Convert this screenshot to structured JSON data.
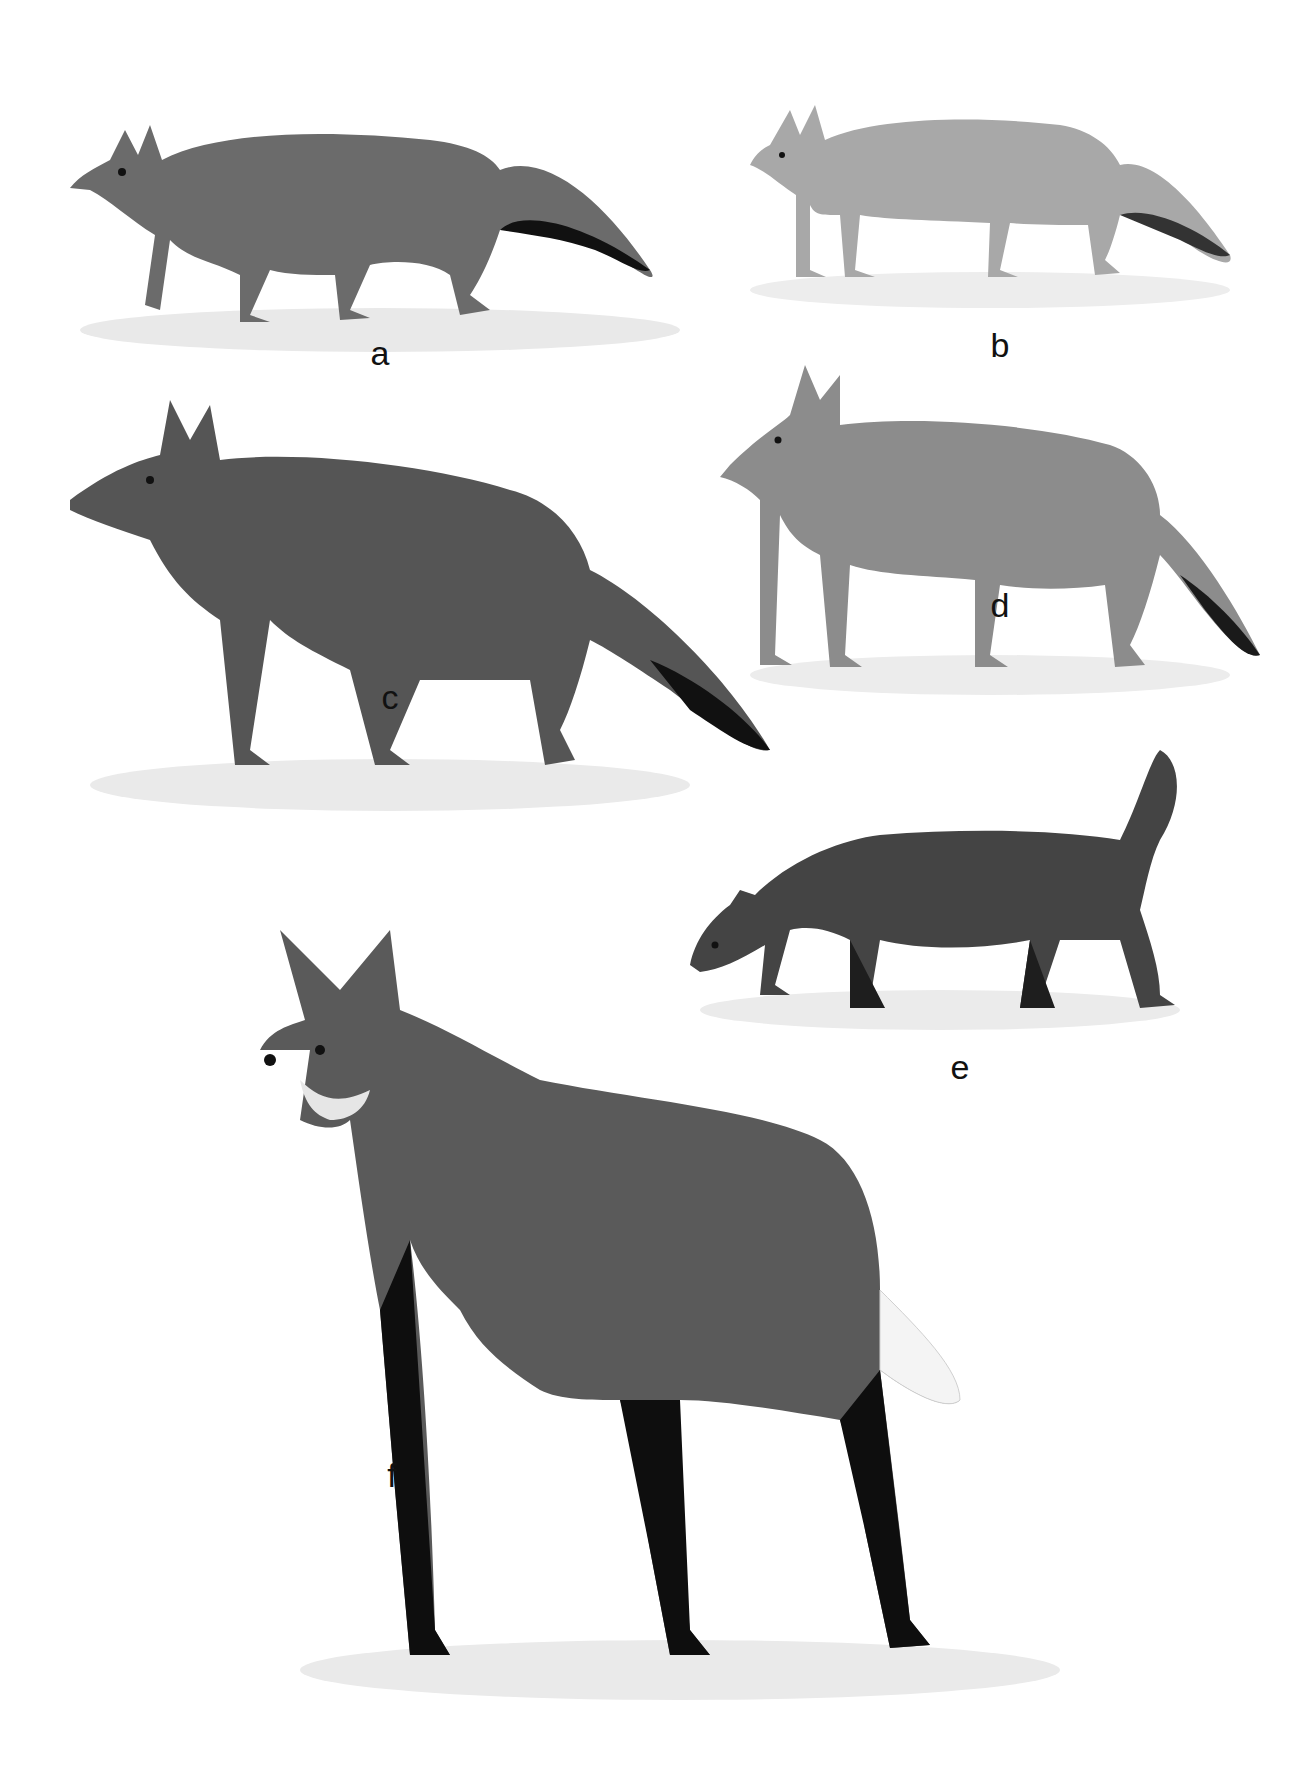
{
  "plate": {
    "background": "#ffffff",
    "figures": [
      {
        "id": "a",
        "label": "a",
        "label_pos": {
          "x": 380,
          "y": 336
        },
        "box": {
          "x": 50,
          "y": 60,
          "w": 660,
          "h": 300
        },
        "tone": "#6b6b6b",
        "leg_tone": "#2a2a2a",
        "tail_tip": "#111111"
      },
      {
        "id": "b",
        "label": "b",
        "label_pos": {
          "x": 1000,
          "y": 328
        },
        "box": {
          "x": 730,
          "y": 55,
          "w": 520,
          "h": 260
        },
        "tone": "#a8a8a8",
        "leg_tone": "#bdbdbd",
        "tail_tip": "#333333"
      },
      {
        "id": "c",
        "label": "c",
        "label_pos": {
          "x": 390,
          "y": 680
        },
        "box": {
          "x": 50,
          "y": 380,
          "w": 740,
          "h": 440
        },
        "tone": "#555555",
        "leg_tone": "#4a4a4a",
        "tail_tip": "#111111"
      },
      {
        "id": "d",
        "label": "d",
        "label_pos": {
          "x": 1000,
          "y": 588
        },
        "box": {
          "x": 720,
          "y": 355,
          "w": 540,
          "h": 350
        },
        "tone": "#8c8c8c",
        "leg_tone": "#a0a0a0",
        "tail_tip": "#1a1a1a"
      },
      {
        "id": "e",
        "label": "e",
        "label_pos": {
          "x": 960,
          "y": 1050
        },
        "box": {
          "x": 680,
          "y": 740,
          "w": 520,
          "h": 300
        },
        "tone": "#444444",
        "leg_tone": "#1e1e1e",
        "tail_tip": "#2a2a2a"
      },
      {
        "id": "f",
        "label": "f",
        "label_pos": {
          "x": 392,
          "y": 1458
        },
        "box": {
          "x": 260,
          "y": 930,
          "w": 840,
          "h": 780
        },
        "tone": "#5a5a5a",
        "leg_tone": "#0e0e0e",
        "tail_tip": "#f4f4f4"
      }
    ]
  }
}
